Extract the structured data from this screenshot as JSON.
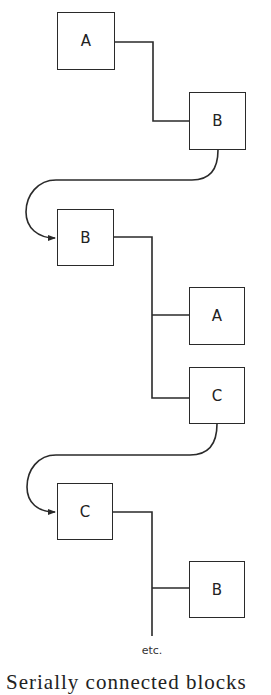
{
  "diagram": {
    "type": "serial connection chain",
    "line_color": "#2a2a2a",
    "boxes": [
      {
        "id": "box1",
        "label": "A",
        "x": 57,
        "y": 12,
        "w": 58,
        "h": 58
      },
      {
        "id": "box2",
        "label": "B",
        "x": 189,
        "y": 92,
        "w": 57,
        "h": 58
      },
      {
        "id": "box3",
        "label": "B",
        "x": 57,
        "y": 209,
        "w": 57,
        "h": 57
      },
      {
        "id": "box4",
        "label": "A",
        "x": 189,
        "y": 287,
        "w": 56,
        "h": 58
      },
      {
        "id": "box5",
        "label": "C",
        "x": 189,
        "y": 367,
        "w": 56,
        "h": 57
      },
      {
        "id": "box6",
        "label": "C",
        "x": 57,
        "y": 483,
        "w": 56,
        "h": 57
      },
      {
        "id": "box7",
        "label": "B",
        "x": 189,
        "y": 561,
        "w": 56,
        "h": 57
      }
    ],
    "connections": [
      {
        "from": "box1",
        "to": "box2",
        "style": "orthogonal"
      },
      {
        "from": "box2",
        "to": "box3",
        "style": "curved-arrow"
      },
      {
        "from": "box3",
        "to": "box4",
        "style": "orthogonal"
      },
      {
        "from": "box3",
        "to": "box5",
        "style": "orthogonal"
      },
      {
        "from": "box5",
        "to": "box6",
        "style": "curved-arrow"
      },
      {
        "from": "box6",
        "to": "box7",
        "style": "orthogonal"
      },
      {
        "from": "box6",
        "to": "continuation",
        "style": "orthogonal"
      }
    ],
    "continuation_label": "etc.",
    "caption": "Serially connected blocks"
  }
}
